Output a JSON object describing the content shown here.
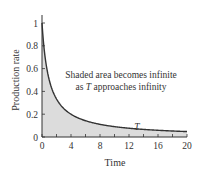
{
  "chart_data": {
    "type": "area",
    "title": "",
    "xlabel": "Time",
    "ylabel": "Production rate",
    "xlim": [
      0,
      20
    ],
    "ylim": [
      0,
      1
    ],
    "xticks": [
      0,
      4,
      8,
      12,
      16,
      20
    ],
    "xminor_ticks": [
      2,
      6,
      10,
      14,
      18
    ],
    "yticks": [
      0,
      0.2,
      0.4,
      0.6,
      0.8,
      1
    ],
    "grid": false,
    "legend": null,
    "function": "y = 1/(1+t)",
    "series": [
      {
        "name": "Production rate",
        "x": [
          0,
          0.5,
          1,
          2,
          3,
          4,
          6,
          8,
          10,
          12,
          14,
          16,
          18,
          20
        ],
        "values": [
          1.0,
          0.667,
          0.5,
          0.333,
          0.25,
          0.2,
          0.143,
          0.111,
          0.091,
          0.077,
          0.067,
          0.059,
          0.053,
          0.048
        ],
        "fill": "#dcdcdc",
        "line_color": "#333333"
      }
    ],
    "annotations": [
      {
        "text_line1": "Shaded area becomes infinite",
        "text_line2_prefix": "as ",
        "text_line2_var": "T",
        "text_line2_suffix": " approaches infinity"
      },
      {
        "text": "T",
        "x": 13,
        "y": 0.09
      }
    ]
  },
  "labels": {
    "xlabel": "Time",
    "ylabel": "Production rate",
    "x_ticks": [
      "0",
      "4",
      "8",
      "12",
      "16",
      "20"
    ],
    "y_ticks": [
      "0",
      "0.2",
      "0.4",
      "0.6",
      "0.8",
      "1"
    ],
    "annotation_line1": "Shaded area becomes infinite",
    "annotation_line2_prefix": "as ",
    "annotation_line2_var": "T",
    "annotation_line2_suffix": " approaches infinity",
    "t_marker": "T"
  }
}
